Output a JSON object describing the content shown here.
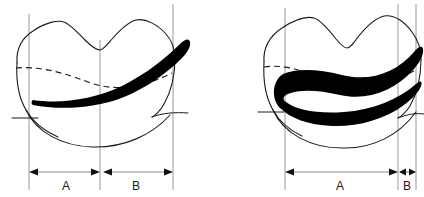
{
  "figure": {
    "background_color": "#ffffff",
    "line_color": "#1a1a1a",
    "reference_line_color": "#999999",
    "dimension_line_color": "#8c8c8c",
    "preparation_color": "#000000",
    "width": 424,
    "height": 197
  },
  "panels": [
    {
      "id": "left-panel",
      "name": "conservative-preparation",
      "dimensions": [
        {
          "key": "A",
          "label": "A",
          "label_x": 66,
          "label_y": 186,
          "line_y": 172,
          "x_start": 29,
          "x_end": 100,
          "arrow_start": true,
          "arrow_end": true
        },
        {
          "key": "B",
          "label": "B",
          "label_x": 136,
          "label_y": 186,
          "line_y": 172,
          "x_start": 103,
          "x_end": 173,
          "arrow_start": true,
          "arrow_end": true
        }
      ],
      "reference_lines": [
        {
          "x": 29,
          "y_top": 14,
          "y_bottom": 190
        },
        {
          "x": 100,
          "y_top": 40,
          "y_bottom": 190
        },
        {
          "x": 173,
          "y_top": 4,
          "y_bottom": 190
        }
      ]
    },
    {
      "id": "right-panel",
      "name": "extended-preparation",
      "dimensions": [
        {
          "key": "A",
          "label": "A",
          "label_x": 340,
          "label_y": 186,
          "line_y": 172,
          "x_start": 285,
          "x_end": 396,
          "arrow_start": true,
          "arrow_end": true
        },
        {
          "key": "B",
          "label": "B",
          "label_x": 407,
          "label_y": 186,
          "line_y": 172,
          "x_start": 399,
          "x_end": 416,
          "arrow_start": true,
          "arrow_end": true
        }
      ],
      "reference_lines": [
        {
          "x": 285,
          "y_top": 8,
          "y_bottom": 190
        },
        {
          "x": 398,
          "y_top": 4,
          "y_bottom": 190
        },
        {
          "x": 416,
          "y_top": 4,
          "y_bottom": 190
        }
      ]
    }
  ]
}
